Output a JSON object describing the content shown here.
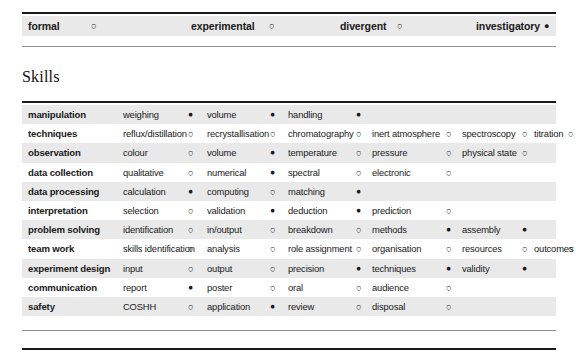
{
  "top_band": {
    "name": "style-descriptor-band",
    "items": [
      {
        "label": "formal",
        "state": "open",
        "label_x": 6,
        "mark_x": 69
      },
      {
        "label": "experimental",
        "state": "open",
        "label_x": 169,
        "mark_x": 247
      },
      {
        "label": "divergent",
        "state": "open",
        "label_x": 318,
        "mark_x": 375
      },
      {
        "label": "investigatory",
        "state": "filled",
        "label_x": 454,
        "mark_x": 522
      }
    ]
  },
  "skills_heading": "Skills",
  "columns_x": {
    "label": 6,
    "item1": 101,
    "mark1": 166,
    "item2": 185,
    "mark2": 248,
    "item3": 266,
    "mark3": 334,
    "item4": 350,
    "mark4": 424,
    "item5": 440,
    "mark5": 500,
    "item6": 512,
    "mark6": 546
  },
  "skills_table": {
    "rows": [
      {
        "label": "manipulation",
        "shaded": true,
        "cells": [
          {
            "text": "weighing",
            "state": "filled"
          },
          {
            "text": "volume",
            "state": "filled"
          },
          {
            "text": "handling",
            "state": "filled"
          }
        ]
      },
      {
        "label": "techniques",
        "shaded": false,
        "cells": [
          {
            "text": "reflux/distillation",
            "state": "open"
          },
          {
            "text": "recrystallisation",
            "state": "open"
          },
          {
            "text": "chromatography",
            "state": "open"
          },
          {
            "text": "inert atmosphere",
            "state": "open"
          },
          {
            "text": "spectroscopy",
            "state": "open"
          },
          {
            "text": "titration",
            "state": "open"
          }
        ]
      },
      {
        "label": "observation",
        "shaded": true,
        "cells": [
          {
            "text": "colour",
            "state": "open"
          },
          {
            "text": "volume",
            "state": "filled"
          },
          {
            "text": "temperature",
            "state": "open"
          },
          {
            "text": "pressure",
            "state": "open"
          },
          {
            "text": "physical state",
            "state": "open"
          }
        ]
      },
      {
        "label": "data collection",
        "shaded": false,
        "cells": [
          {
            "text": "qualitative",
            "state": "open"
          },
          {
            "text": "numerical",
            "state": "filled"
          },
          {
            "text": "spectral",
            "state": "open"
          },
          {
            "text": "electronic",
            "state": "open"
          }
        ]
      },
      {
        "label": "data processing",
        "shaded": true,
        "cells": [
          {
            "text": "calculation",
            "state": "filled"
          },
          {
            "text": "computing",
            "state": "open"
          },
          {
            "text": "matching",
            "state": "filled"
          }
        ]
      },
      {
        "label": "interpretation",
        "shaded": false,
        "cells": [
          {
            "text": "selection",
            "state": "open"
          },
          {
            "text": "validation",
            "state": "filled"
          },
          {
            "text": "deduction",
            "state": "filled"
          },
          {
            "text": "prediction",
            "state": "open"
          }
        ]
      },
      {
        "label": "problem solving",
        "shaded": true,
        "cells": [
          {
            "text": "identification",
            "state": "open"
          },
          {
            "text": "in/output",
            "state": "open"
          },
          {
            "text": "breakdown",
            "state": "open"
          },
          {
            "text": "methods",
            "state": "filled"
          },
          {
            "text": "assembly",
            "state": "filled"
          }
        ]
      },
      {
        "label": "team work",
        "shaded": false,
        "cells": [
          {
            "text": "skills identification",
            "state": "open"
          },
          {
            "text": "analysis",
            "state": "open"
          },
          {
            "text": "role assignment",
            "state": "open"
          },
          {
            "text": "organisation",
            "state": "open"
          },
          {
            "text": "resources",
            "state": "open"
          },
          {
            "text": "outcomes",
            "state": "open"
          }
        ]
      },
      {
        "label": "experiment design",
        "shaded": true,
        "cells": [
          {
            "text": "input",
            "state": "open"
          },
          {
            "text": "output",
            "state": "open"
          },
          {
            "text": "precision",
            "state": "filled"
          },
          {
            "text": "techniques",
            "state": "filled"
          },
          {
            "text": "validity",
            "state": "filled"
          }
        ]
      },
      {
        "label": "communication",
        "shaded": false,
        "cells": [
          {
            "text": "report",
            "state": "filled"
          },
          {
            "text": "poster",
            "state": "open"
          },
          {
            "text": "oral",
            "state": "open"
          },
          {
            "text": "audience",
            "state": "open"
          }
        ]
      },
      {
        "label": "safety",
        "shaded": true,
        "cells": [
          {
            "text": "COSHH",
            "state": "open"
          },
          {
            "text": "application",
            "state": "filled"
          },
          {
            "text": "review",
            "state": "open"
          },
          {
            "text": "disposal",
            "state": "open"
          }
        ]
      }
    ]
  },
  "colors": {
    "shaded_row": "#e9e9e9",
    "rule": "#1a1a1a",
    "thin_rule": "#8e8e8e",
    "text": "#1a1a1a",
    "page_background": "#ffffff"
  }
}
